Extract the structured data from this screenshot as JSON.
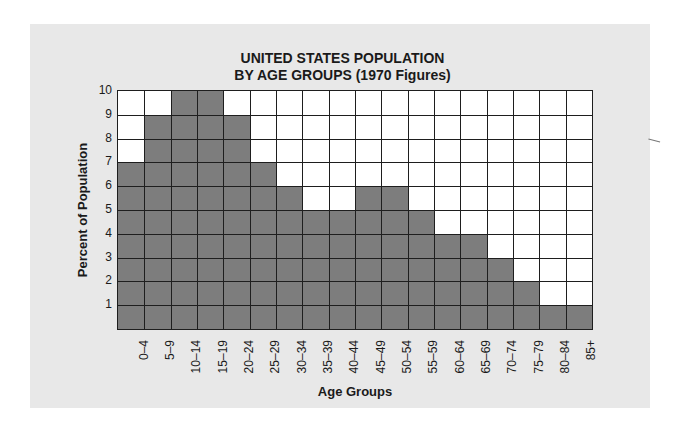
{
  "chart_data": {
    "type": "bar",
    "title": "UNITED STATES POPULATION BY AGE GROUPS (1970 Figures)",
    "title_lines": [
      "UNITED STATES POPULATION",
      "BY AGE GROUPS (1970 Figures)"
    ],
    "xlabel": "Age Groups",
    "ylabel": "Percent of Population",
    "categories": [
      "0–4",
      "5–9",
      "10–14",
      "15–19",
      "20–24",
      "25–29",
      "30–34",
      "35–39",
      "40–44",
      "45–49",
      "50–54",
      "55–59",
      "60–64",
      "65–69",
      "70–74",
      "75–79",
      "80–84",
      "85+"
    ],
    "values": [
      7,
      9,
      10,
      10,
      9,
      7,
      6,
      5,
      5,
      6,
      6,
      5,
      4,
      4,
      3,
      2,
      1,
      1
    ],
    "yticks": [
      "1",
      "2",
      "3",
      "4",
      "5",
      "6",
      "7",
      "8",
      "9",
      "10"
    ],
    "ylim": [
      0,
      10
    ],
    "grid": true,
    "legend": null,
    "colors": {
      "bar": "#7d7d7d",
      "empty_cell": "#ffffff",
      "panel": "#e8e8e8",
      "gridline": "#1e1e1e"
    }
  }
}
